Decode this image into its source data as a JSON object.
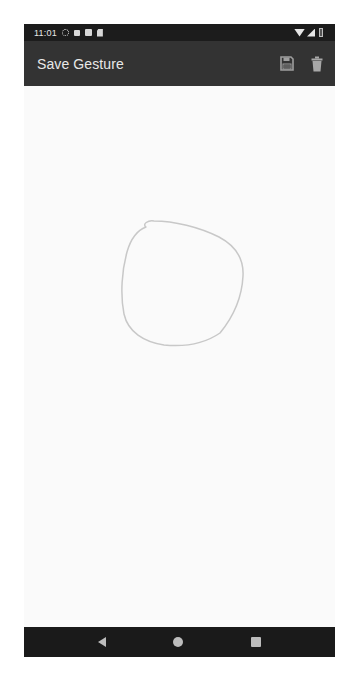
{
  "status_bar": {
    "time": "11:01",
    "left_icons": [
      "settings-icon",
      "notification-icon",
      "photo-icon",
      "sd-card-icon"
    ],
    "right_icons": [
      "wifi-icon",
      "signal-icon",
      "battery-icon"
    ]
  },
  "toolbar": {
    "title": "Save Gesture",
    "actions": [
      {
        "name": "save",
        "icon": "floppy-disk-icon"
      },
      {
        "name": "delete",
        "icon": "trash-icon"
      }
    ],
    "background": "#333333"
  },
  "canvas": {
    "gesture_stroke_color": "#c8c8c8",
    "gesture_shape": "circle"
  },
  "nav_bar": {
    "buttons": [
      "back",
      "home",
      "recents"
    ]
  }
}
